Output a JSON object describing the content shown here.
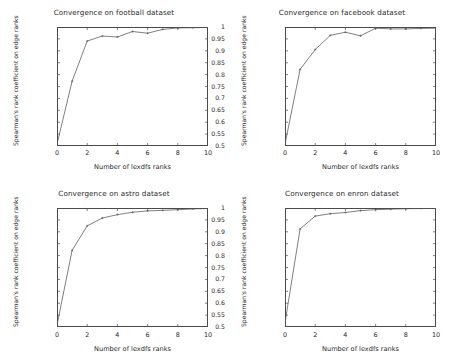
{
  "figure": {
    "background_color": "#ffffff",
    "line_color": "#555555",
    "axis_color": "#4a4a4a",
    "text_color": "#1f1f1f",
    "panel_count": 4
  },
  "chart_data": [
    {
      "type": "line",
      "title": "Convergence on football dataset",
      "xlabel": "Number of lexdfs ranks",
      "ylabel": "Spearman's rank coefficient on edge ranks",
      "xlim": [
        0,
        10
      ],
      "ylim": [
        0.5,
        1
      ],
      "xticks": [
        0,
        2,
        4,
        6,
        8,
        10
      ],
      "xtick_labels": [
        "0",
        "2",
        "4",
        "6",
        "8",
        "10"
      ],
      "yticks": [
        0.5,
        0.55,
        0.6,
        0.65,
        0.7,
        0.75,
        0.8,
        0.85,
        0.9,
        0.95,
        1
      ],
      "ytick_labels": [
        "0.5",
        "0.55",
        "0.6",
        "0.65",
        "0.7",
        "0.75",
        "0.8",
        "0.85",
        "0.9",
        "0.95",
        "1"
      ],
      "grid": false,
      "legend": null,
      "x": [
        0,
        1,
        2,
        3,
        4,
        5,
        6,
        7,
        8,
        9,
        10
      ],
      "values": [
        0.508,
        0.772,
        0.941,
        0.962,
        0.958,
        0.981,
        0.974,
        0.99,
        0.996,
        0.997,
        0.998
      ]
    },
    {
      "type": "line",
      "title": "Convergence on facebook dataset",
      "xlabel": "Number of lexdfs ranks",
      "ylabel": "Spearman's rank coefficient on edge ranks",
      "xlim": [
        0,
        10
      ],
      "ylim": [
        0.5,
        1
      ],
      "xticks": [
        0,
        2,
        4,
        6,
        8,
        10
      ],
      "xtick_labels": [
        "0",
        "2",
        "4",
        "6",
        "8",
        "10"
      ],
      "yticks": [
        0.5,
        0.55,
        0.6,
        0.65,
        0.7,
        0.75,
        0.8,
        0.85,
        0.9,
        0.95,
        1
      ],
      "ytick_labels": [
        "0.5",
        "0.55",
        "0.6",
        "0.65",
        "0.7",
        "0.75",
        "0.8",
        "0.85",
        "0.9",
        "0.95",
        "1"
      ],
      "grid": false,
      "legend": null,
      "x": [
        0,
        1,
        2,
        3,
        4,
        5,
        6,
        7,
        8,
        9,
        10
      ],
      "values": [
        0.508,
        0.822,
        0.905,
        0.965,
        0.978,
        0.963,
        0.995,
        0.992,
        0.992,
        0.994,
        0.995
      ]
    },
    {
      "type": "line",
      "title": "Convergence on astro dataset",
      "xlabel": "Number of lexdfs ranks",
      "ylabel": "Spearman's rank coefficient on edge ranks",
      "xlim": [
        0,
        10
      ],
      "ylim": [
        0.5,
        1
      ],
      "xticks": [
        0,
        2,
        4,
        6,
        8,
        10
      ],
      "xtick_labels": [
        "0",
        "2",
        "4",
        "6",
        "8",
        "10"
      ],
      "yticks": [
        0.5,
        0.55,
        0.6,
        0.65,
        0.7,
        0.75,
        0.8,
        0.85,
        0.9,
        0.95,
        1
      ],
      "ytick_labels": [
        "0.5",
        "0.55",
        "0.6",
        "0.65",
        "0.7",
        "0.75",
        "0.8",
        "0.85",
        "0.9",
        "0.95",
        "1"
      ],
      "grid": false,
      "legend": null,
      "x": [
        0,
        1,
        2,
        3,
        4,
        5,
        6,
        7,
        8,
        9,
        10
      ],
      "values": [
        0.508,
        0.822,
        0.925,
        0.958,
        0.972,
        0.982,
        0.988,
        0.99,
        0.993,
        0.996,
        0.998
      ]
    },
    {
      "type": "line",
      "title": "Convergence on enron dataset",
      "xlabel": "Number of lexdfs ranks",
      "ylabel": "Spearman's rank coefficient on edge ranks",
      "xlim": [
        0,
        10
      ],
      "ylim": [
        0.5,
        1
      ],
      "xticks": [
        0,
        2,
        4,
        6,
        8,
        10
      ],
      "xtick_labels": [
        "0",
        "2",
        "4",
        "6",
        "8",
        "10"
      ],
      "yticks": [
        0.5,
        0.55,
        0.6,
        0.65,
        0.7,
        0.75,
        0.8,
        0.85,
        0.9,
        0.95,
        1
      ],
      "ytick_labels": [
        "0.5",
        "0.55",
        "0.6",
        "0.65",
        "0.7",
        "0.75",
        "0.8",
        "0.85",
        "0.9",
        "0.95",
        "1"
      ],
      "grid": false,
      "legend": null,
      "x": [
        0,
        1,
        2,
        3,
        4,
        5,
        6,
        7,
        8,
        9,
        10
      ],
      "values": [
        0.518,
        0.912,
        0.966,
        0.976,
        0.981,
        0.989,
        0.993,
        0.995,
        0.997,
        0.998,
        0.998
      ]
    }
  ]
}
